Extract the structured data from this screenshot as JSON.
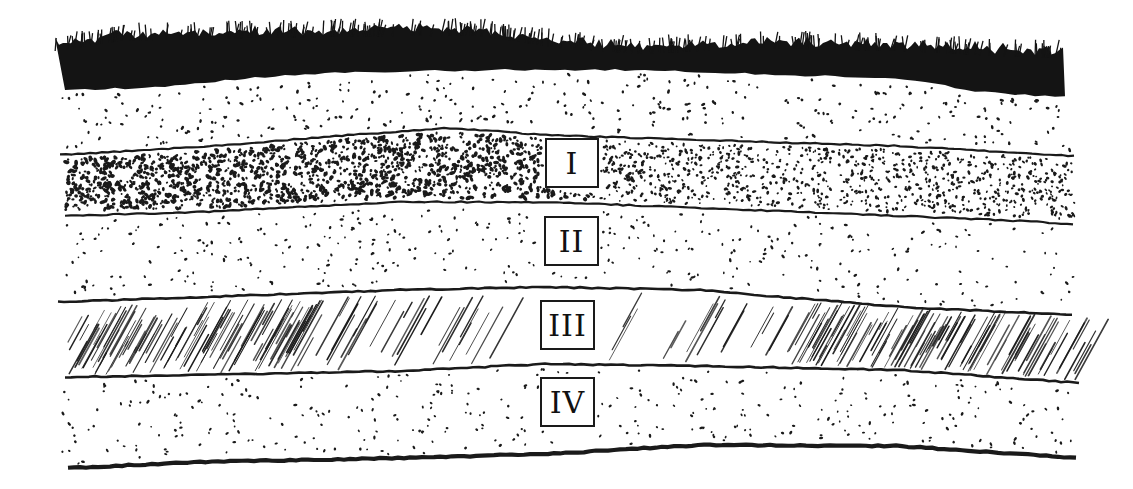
{
  "diagram": {
    "colors": {
      "ink": "#1a1a1a",
      "paper": "#ffffff"
    },
    "layers": [
      {
        "id": "turf",
        "label": "",
        "pattern": "solid-grass",
        "description": "Dark grass/turf top layer"
      },
      {
        "id": "topsoil",
        "label": "",
        "pattern": "sparse-dots",
        "description": "Light stippled upper soil"
      },
      {
        "id": "layer-1",
        "label": "I",
        "pattern": "dense-dots",
        "description": "Dense coarse stippling"
      },
      {
        "id": "layer-2",
        "label": "II",
        "pattern": "sparse-dots",
        "description": "Light stippling"
      },
      {
        "id": "layer-3",
        "label": "III",
        "pattern": "diagonal-hatching",
        "description": "Diagonal hatching"
      },
      {
        "id": "layer-4",
        "label": "IV",
        "pattern": "sparse-dots",
        "description": "Light stippling"
      }
    ]
  }
}
